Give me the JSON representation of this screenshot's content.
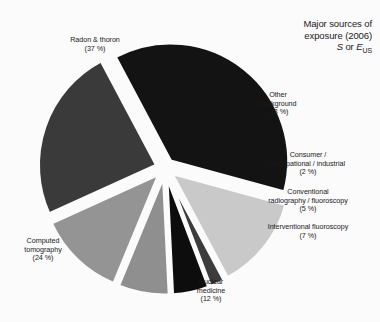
{
  "title": {
    "line1": "Major sources of",
    "line2": "exposure (2006)",
    "symbol_prefix": "S",
    "symbol_mid": " or ",
    "symbol_main": "E",
    "symbol_sub": "US"
  },
  "chart_data": {
    "type": "pie",
    "unit": "%",
    "exploded": true,
    "legend": "none",
    "labels_inline": true,
    "categories": [
      "Radon & thoron",
      "Other background",
      "Consumer / occupational / industrial",
      "Conventional radiography / fluoroscopy",
      "Interventional fluoroscopy",
      "Nuclear medicine",
      "Computed tomography"
    ],
    "values": [
      37,
      13,
      2,
      5,
      7,
      12,
      24
    ],
    "colors": [
      "#131313",
      "#c9c9c9",
      "#3c3c3c",
      "#0d0d0d",
      "#8f8f8f",
      "#949494",
      "#3a3a3a"
    ],
    "slices": [
      {
        "name": "Radon & thoron",
        "value": 37,
        "label": "Radon & thoron",
        "percent_text": "(37 %)",
        "color": "#131313"
      },
      {
        "name": "Other background",
        "value": 13,
        "label": "Other background",
        "percent_text": "(13 %)",
        "color": "#c9c9c9"
      },
      {
        "name": "Consumer / occupational / industrial",
        "value": 2,
        "label": "Consumer / occupational / industrial",
        "percent_text": "(2 %)",
        "color": "#3c3c3c"
      },
      {
        "name": "Conventional radiography / fluoroscopy",
        "value": 5,
        "label": "Conventional radiography / fluoroscopy",
        "percent_text": "(5 %)",
        "color": "#0d0d0d"
      },
      {
        "name": "Interventional fluoroscopy",
        "value": 7,
        "label": "Interventional fluoroscopy",
        "percent_text": "(7 %)",
        "color": "#8f8f8f"
      },
      {
        "name": "Nuclear medicine",
        "value": 12,
        "label": "Nuclear medicine",
        "percent_text": "(12 %)",
        "color": "#949494"
      },
      {
        "name": "Computed tomography",
        "value": 24,
        "label": "Computed tomography",
        "percent_text": "(24 %)",
        "color": "#3a3a3a"
      }
    ]
  },
  "labels": {
    "radon": {
      "l1": "Radon & thoron",
      "l2": "(37 %)"
    },
    "other_background": {
      "l1": "Other",
      "l2": "background",
      "l3": "(13 %)"
    },
    "consumer": {
      "l1": "Consumer /",
      "l2": "occupational / industrial",
      "l3": "(2 %)"
    },
    "conventional": {
      "l1": "Conventional",
      "l2": "radiography / fluoroscopy",
      "l3": "(5 %)"
    },
    "interventional": {
      "l1": "Interventional fluoroscopy",
      "l2": "(7 %)"
    },
    "nuclear": {
      "l1": "Nuclear",
      "l2": "medicine",
      "l3": "(12 %)"
    },
    "ct": {
      "l1": "Computed",
      "l2": "tomography",
      "l3": "(24 %)"
    }
  }
}
